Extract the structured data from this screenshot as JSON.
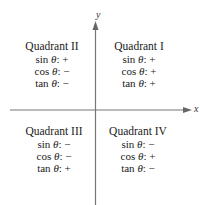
{
  "axes": {
    "x_label": "x",
    "y_label": "y",
    "color": "#777777"
  },
  "quadrants": {
    "q1": {
      "title": "Quadrant I",
      "rows": [
        {
          "fn": "sin",
          "var": "θ",
          "sign": "+"
        },
        {
          "fn": "cos",
          "var": "θ",
          "sign": "+"
        },
        {
          "fn": "tan",
          "var": "θ",
          "sign": "+"
        }
      ]
    },
    "q2": {
      "title": "Quadrant II",
      "rows": [
        {
          "fn": "sin",
          "var": "θ",
          "sign": "+"
        },
        {
          "fn": "cos",
          "var": "θ",
          "sign": "−"
        },
        {
          "fn": "tan",
          "var": "θ",
          "sign": "−"
        }
      ]
    },
    "q3": {
      "title": "Quadrant III",
      "rows": [
        {
          "fn": "sin",
          "var": "θ",
          "sign": "−"
        },
        {
          "fn": "cos",
          "var": "θ",
          "sign": "−"
        },
        {
          "fn": "tan",
          "var": "θ",
          "sign": "+"
        }
      ]
    },
    "q4": {
      "title": "Quadrant IV",
      "rows": [
        {
          "fn": "sin",
          "var": "θ",
          "sign": "−"
        },
        {
          "fn": "cos",
          "var": "θ",
          "sign": "+"
        },
        {
          "fn": "tan",
          "var": "θ",
          "sign": "−"
        }
      ]
    }
  }
}
